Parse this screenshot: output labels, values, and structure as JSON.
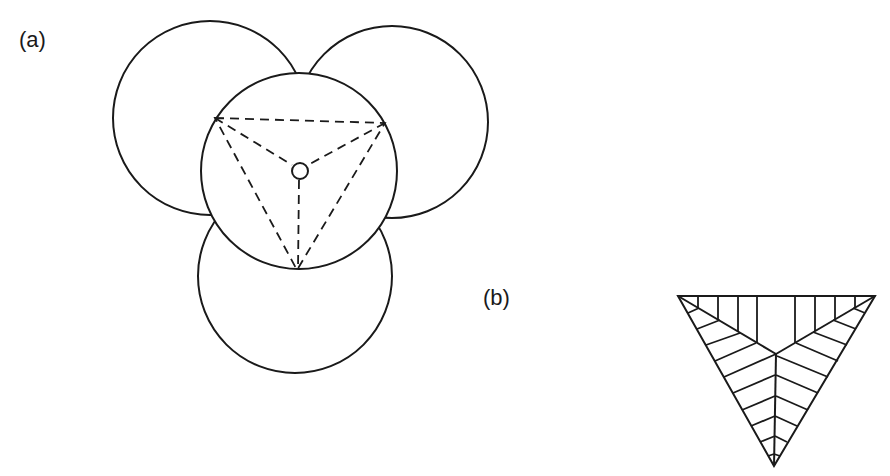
{
  "figure": {
    "panel_a": {
      "label": "(a)",
      "description": "Three outer circles tangent-arranged around a central circle, with an inscribed dashed triangle and dashed lines from vertices to a small central circle"
    },
    "panel_b": {
      "label": "(b)",
      "description": "Equilateral triangle divided into three regions from its centroid, each hatched with lines parallel to a different edge"
    }
  },
  "colors": {
    "stroke": "#1a1a1a",
    "background": "#ffffff"
  }
}
